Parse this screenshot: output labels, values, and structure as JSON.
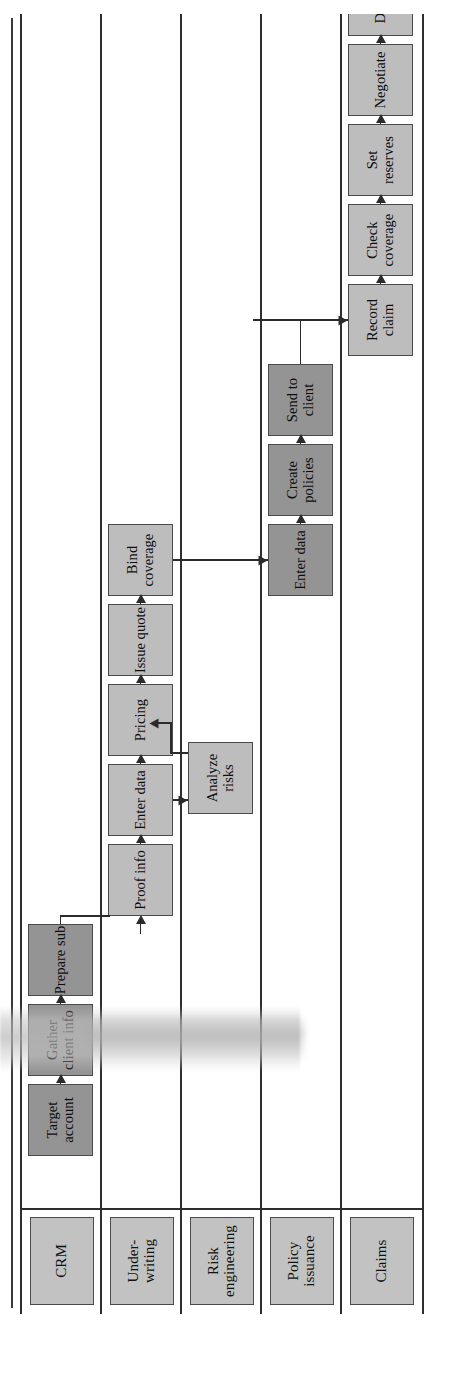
{
  "diagram": {
    "type": "swimlane-process-diagram",
    "orientation": "rotated-90-counterclockwise",
    "colors": {
      "lane_label_fill": "#c2c2c2",
      "task_fill_light": "#bdbdbd",
      "task_fill_dark": "#949494",
      "line": "#2e2e2e",
      "text": "#0d0d0d"
    },
    "lanes": [
      {
        "id": "crm",
        "label": "CRM",
        "shade": "dark",
        "tasks": [
          {
            "id": "target-account",
            "label": "Target account"
          },
          {
            "id": "gather-client-info",
            "label": "Gather client info"
          },
          {
            "id": "prepare-sub",
            "label": "Prepare sub"
          }
        ]
      },
      {
        "id": "underwriting",
        "label": "Under-writing",
        "shade": "light",
        "tasks": [
          {
            "id": "proof-info",
            "label": "Proof info"
          },
          {
            "id": "enter-data-uw",
            "label": "Enter data"
          },
          {
            "id": "pricing",
            "label": "Pricing"
          },
          {
            "id": "issue-quote",
            "label": "Issue quote"
          },
          {
            "id": "bind-coverage",
            "label": "Bind coverage"
          }
        ]
      },
      {
        "id": "risk-engineering",
        "label": "Risk engineering",
        "shade": "light",
        "tasks": [
          {
            "id": "analyze-risks",
            "label": "Analyze risks"
          }
        ]
      },
      {
        "id": "policy-issuance",
        "label": "Policy issuance",
        "shade": "dark",
        "tasks": [
          {
            "id": "enter-data-pi",
            "label": "Enter data"
          },
          {
            "id": "create-policies",
            "label": "Create policies"
          },
          {
            "id": "send-to-client",
            "label": "Send to client"
          }
        ]
      },
      {
        "id": "claims",
        "label": "Claims",
        "shade": "light",
        "tasks": [
          {
            "id": "record-claim",
            "label": "Record claim"
          },
          {
            "id": "check-coverage",
            "label": "Check coverage"
          },
          {
            "id": "set-reserves",
            "label": "Set reserves"
          },
          {
            "id": "negotiate",
            "label": "Negotiate"
          },
          {
            "id": "dispose",
            "label": "Dispose"
          }
        ]
      }
    ]
  }
}
